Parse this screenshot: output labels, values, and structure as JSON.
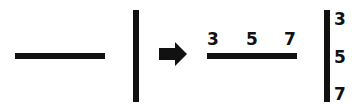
{
  "diagram": {
    "left": {
      "horizontal_line": "plain horizontal line",
      "vertical_line": "plain vertical line"
    },
    "arrow": "right-arrow-icon",
    "right": {
      "horizontal_labels": [
        "3",
        "5",
        "7"
      ],
      "vertical_labels": [
        "3",
        "5",
        "7"
      ]
    },
    "colors": {
      "ink": "#111111",
      "background": "#ffffff"
    }
  }
}
